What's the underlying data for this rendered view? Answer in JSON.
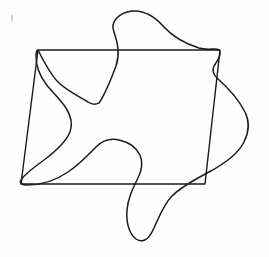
{
  "figure": {
    "title": "Line drawing of a quadrilateral overlapped by a closed freeform curve",
    "background_color": "#fefefe",
    "stroke_color": "#1a1a1a",
    "canvas": {
      "width": 269,
      "height": 257
    },
    "shapes": [
      {
        "name": "quadrilateral",
        "type": "polygon",
        "stroke_width": 1.4,
        "vertices": [
          {
            "label": "top-left",
            "x": 38,
            "y": 50
          },
          {
            "label": "top-right",
            "x": 220,
            "y": 50
          },
          {
            "label": "bottom-right",
            "x": 205,
            "y": 184
          },
          {
            "label": "bottom-left",
            "x": 21,
            "y": 184
          }
        ],
        "path": "M 38 50 L 220 50 L 205 184 L 21 184 Z"
      },
      {
        "name": "freeform-closed-curve",
        "type": "closed-spline",
        "stroke_width": 1.5,
        "path": "M 38 50 C 44 62 50 74 58 82 C 66 90 78 96 88 102 C 94 106 97 104 99 103 C 104 96 110 82 116 66 C 120 54 118 44 114 32 C 110 22 118 13 132 11 C 146 10 156 18 163 26 C 172 36 186 44 199 48 C 210 51 216 47 219 50 C 222 54 218 60 214 66 C 212 70 213 74 217 78 C 226 86 238 98 245 112 C 250 122 249 132 244 142 C 238 154 224 164 209 172 C 196 179 182 186 172 196 C 163 205 158 220 152 232 C 148 240 142 243 136 239 C 129 234 126 222 127 210 C 128 198 133 188 138 178 C 142 170 143 162 140 155 C 136 147 128 142 119 140 C 110 138 102 141 96 147 C 88 155 80 164 68 172 C 55 181 40 185 27 185 C 22 185 19 183 21 180 C 24 175 33 168 44 160 C 56 151 66 142 70 132 C 73 124 71 116 66 108 C 60 99 52 92 46 84 C 40 76 36 66 36 56 C 36 52 37 50 38 50 Z"
      }
    ]
  }
}
